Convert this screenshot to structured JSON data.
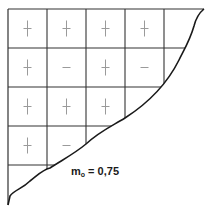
{
  "diagram": {
    "type": "sign-grid",
    "grid": {
      "rows": 5,
      "cols": 5,
      "origin_x": 8,
      "origin_y": 9,
      "cell_size": 39,
      "line_color": "#333333",
      "sign_color": "#9a9a9a"
    },
    "cells": [
      [
        "+",
        "+",
        "+",
        "+",
        ""
      ],
      [
        "+",
        "−",
        "+",
        "−",
        ""
      ],
      [
        "+",
        "+",
        "+",
        "",
        ""
      ],
      [
        "+",
        "−",
        "",
        "",
        ""
      ],
      [
        "",
        "",
        "",
        "",
        ""
      ]
    ],
    "curve_label": {
      "main": "m",
      "sub": "o",
      "value": " = 0,75"
    }
  }
}
